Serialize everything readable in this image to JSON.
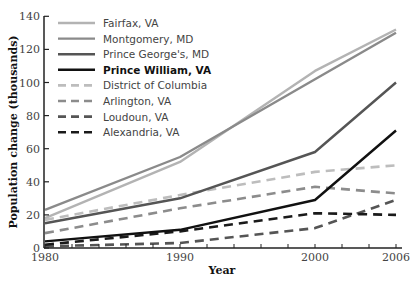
{
  "chart_data": {
    "type": "line",
    "title": "",
    "xlabel": "Year",
    "ylabel": "Population change (thousands)",
    "x": [
      1980,
      1990,
      2000,
      2006
    ],
    "ylim": [
      0,
      140
    ],
    "yticks": [
      0,
      20,
      40,
      60,
      80,
      100,
      120,
      140
    ],
    "xticks": [
      1980,
      1990,
      2000,
      2006
    ],
    "grid": false,
    "legend_position": "upper-left",
    "series": [
      {
        "name": "Fairfax, VA",
        "values": [
          18,
          52,
          107,
          132
        ],
        "color": "#b3b3b3",
        "dash": "solid",
        "width": 2.4,
        "bold": false
      },
      {
        "name": "Montgomery, MD",
        "values": [
          23,
          55,
          102,
          130
        ],
        "color": "#8a8a8a",
        "dash": "solid",
        "width": 2.4,
        "bold": false
      },
      {
        "name": "Prince George's, MD",
        "values": [
          15,
          30,
          58,
          100
        ],
        "color": "#555555",
        "dash": "solid",
        "width": 2.4,
        "bold": false
      },
      {
        "name": "Prince William, VA",
        "values": [
          4,
          11,
          29,
          71
        ],
        "color": "#111111",
        "dash": "solid",
        "width": 2.4,
        "bold": true
      },
      {
        "name": "District of Columbia",
        "values": [
          17,
          32,
          46,
          50
        ],
        "color": "#bdbdbd",
        "dash": "dashed",
        "width": 2.6,
        "bold": false
      },
      {
        "name": "Arlington, VA",
        "values": [
          9,
          24,
          37,
          33
        ],
        "color": "#8c8c8c",
        "dash": "dashed",
        "width": 2.6,
        "bold": false
      },
      {
        "name": "Loudoun, VA",
        "values": [
          1,
          3,
          12,
          29
        ],
        "color": "#555555",
        "dash": "dashed",
        "width": 2.6,
        "bold": false
      },
      {
        "name": "Alexandria, VA",
        "values": [
          2,
          10,
          21,
          20
        ],
        "color": "#1a1a1a",
        "dash": "dashed",
        "width": 2.6,
        "bold": false
      }
    ]
  }
}
